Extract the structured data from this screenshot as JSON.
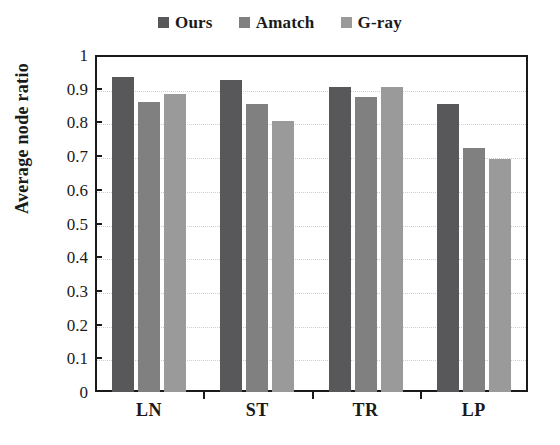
{
  "chart_data": {
    "type": "bar",
    "title": "",
    "xlabel": "",
    "ylabel": "Average node ratio",
    "categories": [
      "LN",
      "ST",
      "TR",
      "LP"
    ],
    "series": [
      {
        "name": "Ours",
        "color": "#58585a",
        "values": [
          0.935,
          0.925,
          0.905,
          0.855
        ]
      },
      {
        "name": "Amatch",
        "color": "#808081",
        "values": [
          0.862,
          0.855,
          0.875,
          0.723
        ]
      },
      {
        "name": "G-ray",
        "color": "#9a9a9a",
        "values": [
          0.885,
          0.805,
          0.905,
          0.69
        ]
      }
    ],
    "ylim": [
      0,
      1
    ],
    "ytick_labels": [
      "1",
      "0.9",
      "0.8",
      "0.7",
      "0.6",
      "0.5",
      "0.4",
      "0.3",
      "0.2",
      "0.1",
      "0"
    ],
    "ytick_values": [
      1,
      0.9,
      0.8,
      0.7,
      0.6,
      0.5,
      0.4,
      0.3,
      0.2,
      0.1,
      0
    ],
    "grid": true,
    "grid_color": "#cfcfcf",
    "legend_position": "top-center",
    "axis_color": "#1a1a1a",
    "background": "#ffffff"
  }
}
